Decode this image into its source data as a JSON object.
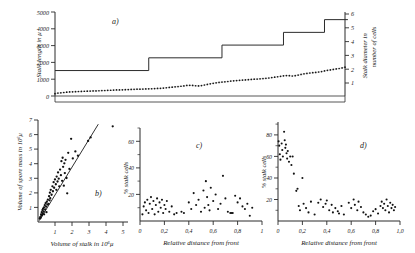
{
  "figure": {
    "background_color": "#ffffff",
    "ink_color": "#1a1a1a",
    "panels": [
      "a)",
      "b)",
      "c)",
      "d)"
    ]
  },
  "panel_a": {
    "label": "a)",
    "ylabel_left": "Stalk length in μ",
    "ylabel_right": "Stalk diameter in number of cells",
    "yticks_left": [
      "0",
      "1000",
      "2000",
      "3000",
      "4000",
      "5000"
    ],
    "yticks_right": [
      "1",
      "2",
      "3",
      "4",
      "5",
      "6"
    ]
  },
  "panel_b": {
    "label": "b)",
    "ylabel": "Volume of spore mass in 10⁶μ",
    "xlabel": "Volume of stalk in 10⁶μ",
    "yticks": [
      "1",
      "2",
      "3",
      "4",
      "5",
      "6",
      "7"
    ],
    "xticks": [
      "1",
      "2",
      "3",
      "4",
      "5"
    ]
  },
  "panel_c": {
    "label": "c)",
    "ylabel": "% stalk cells",
    "xlabel": "Relative distance from front",
    "yticks": [
      "20",
      "40",
      "60"
    ],
    "xticks": [
      "0",
      "0,2",
      "0,4",
      "0,6",
      "0,8",
      "1"
    ]
  },
  "panel_d": {
    "label": "d)",
    "ylabel": "% stalk cells",
    "xlabel": "Relative distance from front",
    "yticks": [
      "20",
      "40",
      "60",
      "80"
    ],
    "xticks": [
      "0",
      "0,2",
      "0,4",
      "0,6",
      "0,8",
      "1,0"
    ]
  },
  "chart_data": [
    {
      "type": "line",
      "panel": "a)",
      "title": "",
      "xlabel": "",
      "ylabel": "Stalk length in μ",
      "ylabel_secondary": "Stalk diameter in number of cells",
      "ylim": [
        0,
        5500
      ],
      "ylim_secondary": [
        0,
        6.6
      ],
      "grid": false,
      "legend": "none",
      "series": [
        {
          "name": "Stalk length",
          "marker": "dots",
          "axis": "left",
          "x": [
            0,
            1,
            2,
            3,
            4,
            5,
            6,
            7,
            8,
            9,
            10,
            11,
            12,
            13,
            14,
            15,
            16,
            17,
            18,
            19,
            20,
            21,
            22,
            23,
            24,
            25,
            26,
            27,
            28,
            29,
            30,
            31,
            32,
            33,
            34,
            35,
            36,
            37,
            38,
            39,
            40,
            41,
            42,
            43,
            44,
            45,
            46,
            47,
            48,
            49,
            50,
            51,
            52,
            53,
            54,
            55,
            56,
            57,
            58,
            59,
            60,
            61,
            62,
            63,
            64,
            65,
            66,
            67,
            68,
            69,
            70,
            71,
            72,
            73,
            74,
            75,
            76,
            77,
            78,
            79,
            80,
            81,
            82,
            83,
            84,
            85,
            86,
            87,
            88,
            89,
            90,
            91,
            92,
            93,
            94,
            95,
            96,
            97,
            98,
            99
          ],
          "values": [
            150,
            190,
            210,
            230,
            250,
            265,
            275,
            285,
            295,
            300,
            310,
            315,
            320,
            330,
            335,
            345,
            355,
            360,
            370,
            375,
            385,
            395,
            400,
            405,
            415,
            420,
            430,
            440,
            445,
            450,
            455,
            460,
            470,
            475,
            485,
            495,
            505,
            520,
            540,
            560,
            580,
            600,
            620,
            640,
            660,
            690,
            700,
            690,
            670,
            660,
            680,
            720,
            760,
            800,
            830,
            860,
            890,
            910,
            930,
            950,
            975,
            995,
            1010,
            1025,
            1040,
            1055,
            1070,
            1085,
            1100,
            1110,
            1125,
            1140,
            1160,
            1180,
            1205,
            1230,
            1260,
            1290,
            1320,
            1340,
            1330,
            1310,
            1330,
            1370,
            1410,
            1450,
            1480,
            1505,
            1525,
            1545,
            1570,
            1600,
            1640,
            1680,
            1710,
            1740,
            1770,
            1800,
            1840,
            1890,
            1940
          ]
        },
        {
          "name": "Stalk diameter",
          "marker": "step",
          "axis": "right",
          "step_x": [
            0,
            32,
            32,
            57,
            57,
            78,
            78,
            92,
            92,
            100
          ],
          "step_values": [
            2,
            2,
            3,
            3,
            4,
            4,
            5,
            5,
            6,
            6
          ]
        }
      ]
    },
    {
      "type": "scatter",
      "panel": "b)",
      "title": "",
      "xlabel": "Volume of stalk in 10⁶μ",
      "ylabel": "Volume of spore mass in 10⁶μ",
      "xlim": [
        0,
        5.3
      ],
      "ylim": [
        0,
        7.3
      ],
      "grid": false,
      "legend": "none",
      "regression_line": {
        "x": [
          0.08,
          3.55
        ],
        "y": [
          0.1,
          7.0
        ]
      },
      "points": [
        [
          0.1,
          0.25
        ],
        [
          0.13,
          0.35
        ],
        [
          0.16,
          0.3
        ],
        [
          0.18,
          0.55
        ],
        [
          0.2,
          0.45
        ],
        [
          0.22,
          0.7
        ],
        [
          0.24,
          0.5
        ],
        [
          0.26,
          0.85
        ],
        [
          0.28,
          0.62
        ],
        [
          0.3,
          0.95
        ],
        [
          0.33,
          0.75
        ],
        [
          0.35,
          1.05
        ],
        [
          0.36,
          0.55
        ],
        [
          0.4,
          1.2
        ],
        [
          0.42,
          0.9
        ],
        [
          0.45,
          1.35
        ],
        [
          0.48,
          1.1
        ],
        [
          0.5,
          0.7
        ],
        [
          0.52,
          1.45
        ],
        [
          0.55,
          1.25
        ],
        [
          0.58,
          1.6
        ],
        [
          0.62,
          1.3
        ],
        [
          0.65,
          1.85
        ],
        [
          0.68,
          1.55
        ],
        [
          0.7,
          2.1
        ],
        [
          0.72,
          1.7
        ],
        [
          0.75,
          2.3
        ],
        [
          0.8,
          1.95
        ],
        [
          0.85,
          2.55
        ],
        [
          0.88,
          2.2
        ],
        [
          0.92,
          2.85
        ],
        [
          0.95,
          2.45
        ],
        [
          1.0,
          3.05
        ],
        [
          1.05,
          2.7
        ],
        [
          1.08,
          2.3
        ],
        [
          1.1,
          3.25
        ],
        [
          1.15,
          2.9
        ],
        [
          1.18,
          3.55
        ],
        [
          1.22,
          3.1
        ],
        [
          1.25,
          2.55
        ],
        [
          1.3,
          3.75
        ],
        [
          1.35,
          3.35
        ],
        [
          1.38,
          4.35
        ],
        [
          1.42,
          2.95
        ],
        [
          1.45,
          4.6
        ],
        [
          1.48,
          3.95
        ],
        [
          1.52,
          2.6
        ],
        [
          1.55,
          4.2
        ],
        [
          1.58,
          3.5
        ],
        [
          1.62,
          4.45
        ],
        [
          1.68,
          3.15
        ],
        [
          1.72,
          2.05
        ],
        [
          1.78,
          4.95
        ],
        [
          1.85,
          3.8
        ],
        [
          1.95,
          5.95
        ],
        [
          2.05,
          4.55
        ],
        [
          2.2,
          5.05
        ],
        [
          2.35,
          4.75
        ],
        [
          2.95,
          5.8
        ],
        [
          3.1,
          6.05
        ],
        [
          4.4,
          6.85
        ]
      ]
    },
    {
      "type": "scatter",
      "panel": "c)",
      "title": "",
      "xlabel": "Relative distance from front",
      "ylabel": "% stalk cells",
      "xlim": [
        0,
        1.0
      ],
      "ylim": [
        0,
        70
      ],
      "grid": false,
      "legend": "none",
      "points": [
        [
          0.02,
          5
        ],
        [
          0.03,
          11
        ],
        [
          0.04,
          14
        ],
        [
          0.05,
          8
        ],
        [
          0.06,
          16
        ],
        [
          0.07,
          6
        ],
        [
          0.08,
          13
        ],
        [
          0.09,
          18
        ],
        [
          0.1,
          9
        ],
        [
          0.11,
          15
        ],
        [
          0.12,
          5
        ],
        [
          0.13,
          12
        ],
        [
          0.14,
          17
        ],
        [
          0.15,
          7
        ],
        [
          0.16,
          14
        ],
        [
          0.17,
          10
        ],
        [
          0.18,
          16
        ],
        [
          0.19,
          6
        ],
        [
          0.2,
          12
        ],
        [
          0.21,
          9
        ],
        [
          0.22,
          15
        ],
        [
          0.24,
          7
        ],
        [
          0.26,
          11
        ],
        [
          0.28,
          5
        ],
        [
          0.3,
          6
        ],
        [
          0.34,
          7
        ],
        [
          0.36,
          6
        ],
        [
          0.4,
          14
        ],
        [
          0.42,
          9
        ],
        [
          0.44,
          21
        ],
        [
          0.46,
          12
        ],
        [
          0.48,
          16
        ],
        [
          0.5,
          7
        ],
        [
          0.52,
          23
        ],
        [
          0.53,
          10
        ],
        [
          0.54,
          30
        ],
        [
          0.55,
          18
        ],
        [
          0.56,
          12
        ],
        [
          0.57,
          8
        ],
        [
          0.58,
          25
        ],
        [
          0.6,
          15
        ],
        [
          0.62,
          20
        ],
        [
          0.64,
          9
        ],
        [
          0.66,
          13
        ],
        [
          0.68,
          34
        ],
        [
          0.7,
          17
        ],
        [
          0.72,
          7
        ],
        [
          0.74,
          6
        ],
        [
          0.75,
          6
        ],
        [
          0.76,
          6
        ],
        [
          0.78,
          19
        ],
        [
          0.8,
          14
        ],
        [
          0.82,
          17
        ],
        [
          0.84,
          11
        ],
        [
          0.86,
          9
        ],
        [
          0.88,
          13
        ],
        [
          0.9,
          4
        ],
        [
          0.92,
          10
        ]
      ]
    },
    {
      "type": "scatter",
      "panel": "d)",
      "title": "",
      "xlabel": "Relative distance from front",
      "ylabel": "% stalk cells",
      "xlim": [
        0,
        1.0
      ],
      "ylim": [
        0,
        92
      ],
      "grid": false,
      "legend": "none",
      "points": [
        [
          0.005,
          74
        ],
        [
          0.01,
          70
        ],
        [
          0.015,
          62
        ],
        [
          0.02,
          57
        ],
        [
          0.03,
          72
        ],
        [
          0.035,
          66
        ],
        [
          0.04,
          60
        ],
        [
          0.05,
          83
        ],
        [
          0.055,
          75
        ],
        [
          0.06,
          68
        ],
        [
          0.065,
          71
        ],
        [
          0.07,
          63
        ],
        [
          0.075,
          58
        ],
        [
          0.08,
          65
        ],
        [
          0.09,
          55
        ],
        [
          0.1,
          60
        ],
        [
          0.11,
          52
        ],
        [
          0.12,
          60
        ],
        [
          0.13,
          44
        ],
        [
          0.15,
          28
        ],
        [
          0.16,
          30
        ],
        [
          0.17,
          14
        ],
        [
          0.18,
          10
        ],
        [
          0.2,
          40
        ],
        [
          0.21,
          16
        ],
        [
          0.23,
          12
        ],
        [
          0.25,
          8
        ],
        [
          0.27,
          18
        ],
        [
          0.3,
          6
        ],
        [
          0.33,
          17
        ],
        [
          0.35,
          20
        ],
        [
          0.37,
          13
        ],
        [
          0.39,
          16
        ],
        [
          0.4,
          19
        ],
        [
          0.42,
          10
        ],
        [
          0.44,
          15
        ],
        [
          0.45,
          8
        ],
        [
          0.47,
          12
        ],
        [
          0.49,
          9
        ],
        [
          0.5,
          7
        ],
        [
          0.52,
          14
        ],
        [
          0.54,
          6
        ],
        [
          0.58,
          17
        ],
        [
          0.6,
          12
        ],
        [
          0.62,
          20
        ],
        [
          0.63,
          15
        ],
        [
          0.65,
          10
        ],
        [
          0.66,
          18
        ],
        [
          0.68,
          13
        ],
        [
          0.7,
          8
        ],
        [
          0.72,
          6
        ],
        [
          0.74,
          4
        ],
        [
          0.76,
          5
        ],
        [
          0.78,
          9
        ],
        [
          0.8,
          11
        ],
        [
          0.82,
          7
        ],
        [
          0.84,
          14
        ],
        [
          0.85,
          18
        ],
        [
          0.86,
          12
        ],
        [
          0.87,
          16
        ],
        [
          0.88,
          10
        ],
        [
          0.89,
          20
        ],
        [
          0.9,
          14
        ],
        [
          0.91,
          8
        ],
        [
          0.92,
          17
        ],
        [
          0.93,
          12
        ],
        [
          0.94,
          15
        ],
        [
          0.95,
          10
        ],
        [
          0.96,
          13
        ]
      ]
    }
  ]
}
